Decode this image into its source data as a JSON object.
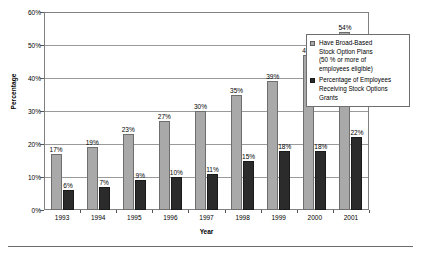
{
  "chart_data": {
    "type": "bar",
    "title": "",
    "subtitle": "",
    "xlabel": "Year",
    "ylabel": "Percentage",
    "categories": [
      "1993",
      "1994",
      "1995",
      "1996",
      "1997",
      "1998",
      "1999",
      "2000",
      "2001"
    ],
    "series": [
      {
        "name": "Have Broad-Based Stock Option Plans (50 % or more of employees eligible)",
        "color": "#a9a9a9",
        "values": [
          17,
          19,
          23,
          27,
          30,
          35,
          39,
          47,
          54
        ],
        "labels": [
          "17%",
          "19%",
          "23%",
          "27%",
          "30%",
          "35%",
          "39%",
          "47%",
          "54%"
        ]
      },
      {
        "name": "Percentage of Employees Receiving Stock Options Grants",
        "color": "#2b2b2b",
        "values": [
          6,
          7,
          9,
          10,
          11,
          15,
          18,
          18,
          22
        ],
        "labels": [
          "6%",
          "7%",
          "9%",
          "10%",
          "11%",
          "15%",
          "18%",
          "18%",
          "22%"
        ]
      }
    ],
    "ylim": [
      0,
      60
    ],
    "ytick_values": [
      0,
      10,
      20,
      30,
      40,
      50,
      60
    ],
    "ytick_labels": [
      "0%",
      "10%",
      "20%",
      "30%",
      "40%",
      "50%",
      "60%"
    ],
    "grid": true,
    "grid_axis": "y",
    "legend_position": "upper right",
    "legend_entries": [
      {
        "swatch": "series-0",
        "lines": [
          "Have Broad-Based",
          "Stock Option Plans",
          "(50 % or more of",
          "employees eligible)"
        ]
      },
      {
        "swatch": "series-1",
        "lines": [
          "Percentage of Employees",
          "Receiving Stock Options",
          "Grants"
        ]
      }
    ]
  }
}
